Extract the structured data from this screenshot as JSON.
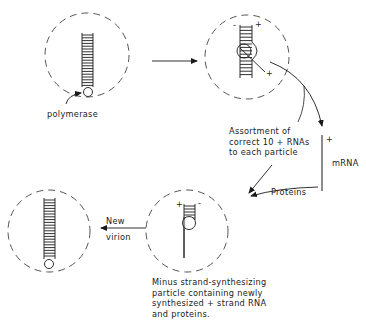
{
  "diagram": {
    "type": "viral replication cycle",
    "stages": [
      {
        "id": "virion",
        "description": "Particle with double-stranded RNA and polymerase"
      },
      {
        "id": "transcribing-particle",
        "description": "Polymerase transcribing + strand",
        "strand_labels": [
          "-",
          "+",
          "+"
        ]
      },
      {
        "id": "minus-strand-synthesizing",
        "description": "Minus strand-synthesizing particle",
        "strand_labels": [
          "+",
          "-"
        ]
      },
      {
        "id": "new-virion",
        "description": "Completed new virion"
      }
    ],
    "labels": {
      "polymerase": "polymerase",
      "assortment": [
        "Assortment of",
        "correct 10 + RNAs",
        "to each particle"
      ],
      "mrna": "mRNA",
      "mrna_sign": "+",
      "proteins": "Proteins",
      "new_virion": [
        "New",
        "virion"
      ],
      "minus_strand": [
        "Minus strand-synthesizing",
        "particle containing newly",
        "synthesized + strand RNA",
        "and proteins."
      ]
    },
    "signs": {
      "p2_minus": "-",
      "p2_plus_top": "+",
      "p2_plus_tail": "+",
      "p4_plus": "+",
      "p4_minus": "-"
    },
    "colors": {
      "line": "#1a1a1a",
      "dash": "#555555",
      "background": "#ffffff"
    }
  }
}
